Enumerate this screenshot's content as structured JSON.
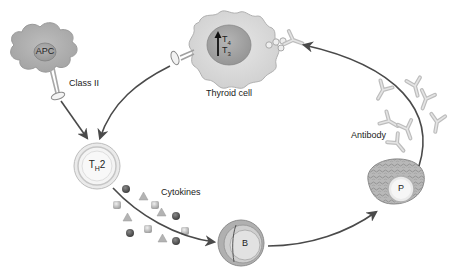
{
  "diagram": {
    "type": "immunology-pathway",
    "nodes": {
      "apc": {
        "label": "APC",
        "receptor_label": "Class II"
      },
      "thyroid_cell": {
        "label": "Thyroid cell",
        "hormone_top": "T",
        "hormone_top_sub": "4",
        "hormone_bottom": "T",
        "hormone_bottom_sub": "3",
        "hormone_direction": "up"
      },
      "th2": {
        "label_main": "T",
        "label_sub": "H",
        "label_suffix": "2"
      },
      "cytokines": {
        "label": "Cytokines"
      },
      "b_cell": {
        "label": "B"
      },
      "plasma_cell": {
        "label": "P"
      },
      "antibody": {
        "label": "Antibody"
      }
    },
    "edges": [
      {
        "from": "apc",
        "to": "th2"
      },
      {
        "from": "thyroid_cell",
        "to": "th2"
      },
      {
        "from": "th2",
        "to": "b_cell",
        "via": "cytokines"
      },
      {
        "from": "b_cell",
        "to": "plasma_cell"
      },
      {
        "from": "plasma_cell",
        "to": "thyroid_cell",
        "via": "antibody"
      }
    ],
    "colors": {
      "cell_fill": "#c8c8c8",
      "cell_fill_light": "#e2e2e2",
      "nucleus_fill": "#a6a6a6",
      "outline": "#8c8c8c",
      "arrow": "#4a4a4a",
      "text": "#222222"
    }
  }
}
